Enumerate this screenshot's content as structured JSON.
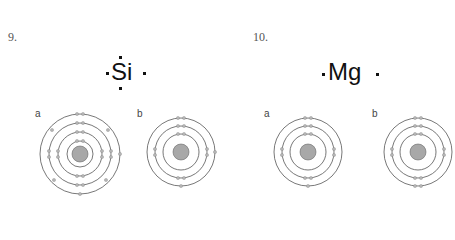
{
  "questions": [
    {
      "number": "9.",
      "element": "Si",
      "lewis_dots": {
        "top": 1,
        "bottom": 1,
        "left": 1,
        "right": 1
      },
      "options": [
        {
          "label": "a",
          "shells": [
            2,
            8,
            8,
            4
          ]
        },
        {
          "label": "b",
          "shells": [
            2,
            8,
            4
          ]
        }
      ]
    },
    {
      "number": "10.",
      "element": "Mg",
      "lewis_dots": {
        "top": 0,
        "bottom": 0,
        "left": 1,
        "right": 1
      },
      "options": [
        {
          "label": "a",
          "shells": [
            2,
            8,
            2
          ]
        },
        {
          "label": "b",
          "shells": [
            2,
            8,
            2
          ]
        }
      ]
    }
  ],
  "colors": {
    "shell": "#555555",
    "electron": "#b5b5b5",
    "nucleus": "#a8a8a8"
  }
}
